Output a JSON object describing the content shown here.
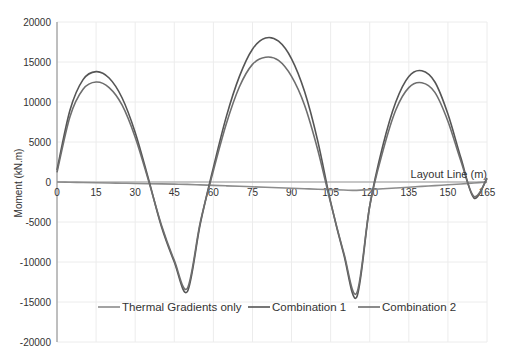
{
  "chart_data": {
    "type": "line",
    "title": "",
    "xlabel": "Layout Line (m)",
    "ylabel": "Moment (kN.m)",
    "xlim": [
      0,
      165
    ],
    "ylim": [
      -20000,
      20000
    ],
    "x_ticks": [
      0,
      15,
      30,
      45,
      60,
      75,
      90,
      105,
      120,
      135,
      150,
      165
    ],
    "y_ticks": [
      20000,
      15000,
      10000,
      5000,
      0,
      -5000,
      -10000,
      -15000,
      -20000
    ],
    "grid": true,
    "legend_position": "inside-bottom",
    "x": [
      0,
      5,
      10,
      15,
      20,
      25,
      30,
      35,
      40,
      45,
      50,
      55,
      60,
      65,
      70,
      75,
      80,
      85,
      90,
      95,
      100,
      105,
      110,
      115,
      120,
      125,
      130,
      135,
      140,
      145,
      150,
      155,
      160,
      165
    ],
    "series": [
      {
        "name": "Thermal Gradients only",
        "values": [
          0,
          -30,
          -60,
          -90,
          -120,
          -150,
          -180,
          -210,
          -240,
          -270,
          -300,
          -360,
          -420,
          -480,
          -540,
          -600,
          -660,
          -720,
          -780,
          -840,
          -900,
          -950,
          -1000,
          -1050,
          -950,
          -850,
          -750,
          -650,
          -550,
          -450,
          -350,
          -250,
          -120,
          0
        ]
      },
      {
        "name": "Combination 1",
        "values": [
          1500,
          9000,
          12800,
          13800,
          13000,
          10500,
          6200,
          500,
          -5500,
          -10000,
          -13700,
          -5200,
          1800,
          8200,
          13200,
          16600,
          18000,
          17600,
          15400,
          11300,
          5200,
          -2500,
          -9000,
          -14400,
          -3000,
          4500,
          10000,
          13200,
          13900,
          12500,
          8500,
          3000,
          -2000,
          500
        ]
      },
      {
        "name": "Combination 2",
        "values": [
          1200,
          8200,
          11600,
          12500,
          11800,
          9600,
          5600,
          300,
          -5300,
          -9800,
          -13300,
          -5000,
          1400,
          7300,
          11900,
          14700,
          15600,
          15200,
          13200,
          9600,
          4100,
          -2600,
          -8800,
          -13900,
          -3000,
          3800,
          9000,
          11800,
          12400,
          11200,
          7600,
          2600,
          -1800,
          400
        ]
      }
    ]
  },
  "axes": {
    "xlabel": "Layout Line (m)",
    "ylabel": "Moment (kN.m)",
    "x_tick_labels": [
      "0",
      "15",
      "30",
      "45",
      "60",
      "75",
      "90",
      "105",
      "120",
      "135",
      "150",
      "165"
    ],
    "y_tick_labels": [
      "20000",
      "15000",
      "10000",
      "5000",
      "0",
      "-5000",
      "-10000",
      "-15000",
      "-20000"
    ]
  },
  "legend": {
    "items": [
      "Thermal Gradients only",
      "Combination 1",
      "Combination 2"
    ]
  },
  "colors": {
    "thermal": "#8c8c8c",
    "combination1": "#555555",
    "combination2": "#6e6e6e",
    "grid": "#ececec",
    "axis": "#888888"
  }
}
